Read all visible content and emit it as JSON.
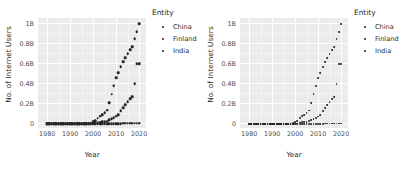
{
  "figure": {
    "panels": [
      {
        "name": "left-panel",
        "marker_size_px": 2.6
      },
      {
        "name": "right-panel",
        "marker_size_px": 1.8
      }
    ],
    "background": "#ffffff",
    "panel_background": "#ebebeb",
    "gridline_color": "#ffffff",
    "marker_color": "#262626"
  },
  "legend": {
    "title": "Entity",
    "position": "right",
    "items": [
      {
        "label": "China",
        "marker": "dot",
        "color": "#262626"
      },
      {
        "label": "Finland",
        "marker": "dot",
        "color": "#262626"
      },
      {
        "label": "India",
        "marker": "dot",
        "color": "#262626"
      }
    ]
  },
  "chart_data": {
    "type": "scatter",
    "title": "",
    "xlabel": "Year",
    "ylabel": "No. of Internet Users",
    "xlim": [
      1976,
      2023
    ],
    "ylim": [
      -0.04,
      1.06
    ],
    "xticks": [
      1980,
      1990,
      2000,
      2010,
      2020
    ],
    "xticklabels": [
      "1980",
      "1990",
      "2000",
      "2010",
      "2020"
    ],
    "yticks": [
      0,
      0.2,
      0.4,
      0.6,
      0.8,
      1.0
    ],
    "yticklabels": [
      "0",
      "0.2B",
      "0.4B",
      "0.6B",
      "0.8B",
      "1B"
    ],
    "y_units": "billions of internet users",
    "grid": true,
    "legend_position": "right",
    "x": [
      1980,
      1981,
      1982,
      1983,
      1984,
      1985,
      1986,
      1987,
      1988,
      1989,
      1990,
      1991,
      1992,
      1993,
      1994,
      1995,
      1996,
      1997,
      1998,
      1999,
      2000,
      2001,
      2002,
      2003,
      2004,
      2005,
      2006,
      2007,
      2008,
      2009,
      2010,
      2011,
      2012,
      2013,
      2014,
      2015,
      2016,
      2017,
      2018,
      2019,
      2020
    ],
    "series": [
      {
        "name": "China",
        "values": [
          0,
          0,
          0,
          0,
          0,
          0,
          0,
          0,
          0,
          0,
          0,
          0,
          0,
          0,
          0,
          0.0001,
          0.0004,
          0.0009,
          0.002,
          0.009,
          0.022,
          0.034,
          0.059,
          0.079,
          0.094,
          0.111,
          0.137,
          0.21,
          0.298,
          0.384,
          0.46,
          0.515,
          0.57,
          0.62,
          0.66,
          0.705,
          0.74,
          0.775,
          0.85,
          0.92,
          1.0
        ]
      },
      {
        "name": "Finland",
        "values": [
          0,
          0,
          0,
          0,
          0,
          0,
          0,
          0,
          0,
          0,
          0,
          0.0001,
          0.0002,
          0.0004,
          0.0007,
          0.0008,
          0.0009,
          0.0011,
          0.0015,
          0.0017,
          0.0019,
          0.0022,
          0.0032,
          0.0035,
          0.0038,
          0.0041,
          0.0042,
          0.0043,
          0.0045,
          0.0047,
          0.0049,
          0.005,
          0.0051,
          0.0052,
          0.0053,
          0.0054,
          0.0055,
          0.0056,
          0.0057,
          0.0058,
          0.0059
        ]
      },
      {
        "name": "India",
        "values": [
          0,
          0,
          0,
          0,
          0,
          0,
          0,
          0,
          0,
          0,
          0,
          0,
          0,
          0,
          0,
          0.00025,
          0.0006,
          0.0012,
          0.0021,
          0.0028,
          0.0055,
          0.007,
          0.016,
          0.018,
          0.02,
          0.025,
          0.029,
          0.04,
          0.053,
          0.061,
          0.076,
          0.09,
          0.13,
          0.16,
          0.19,
          0.22,
          0.25,
          0.27,
          0.4,
          0.6,
          0.6
        ]
      }
    ]
  }
}
